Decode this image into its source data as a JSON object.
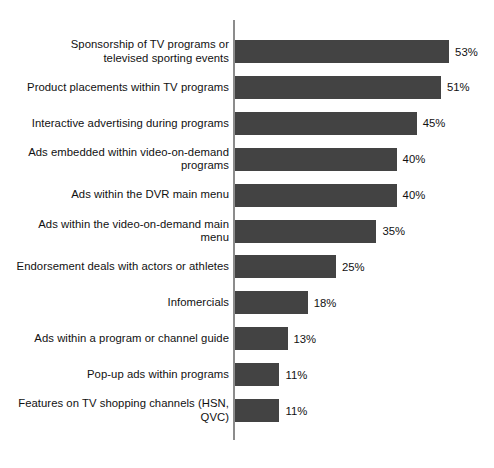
{
  "chart_data": {
    "type": "bar",
    "orientation": "horizontal",
    "title": "",
    "subtitle": "",
    "xlabel": "",
    "ylabel": "",
    "xlim": [
      0,
      53
    ],
    "grid": false,
    "legend": null,
    "value_suffix": "%",
    "bar_color": "#434343",
    "axis_color": "#8c8c8c",
    "background_color": "#ffffff",
    "text_color": "#111111",
    "categories": [
      "Sponsorship of TV programs or\ntelevised sporting events",
      "Product placements within TV programs",
      "Interactive advertising during programs",
      "Ads embedded within video-on-demand\nprograms",
      "Ads within the DVR main menu",
      "Ads within the video-on-demand main menu",
      "Endorsement deals with actors or athletes",
      "Infomercials",
      "Ads within a program or channel guide",
      "Pop-up ads within programs",
      "Features on TV shopping channels (HSN, QVC)"
    ],
    "values": [
      53,
      51,
      45,
      40,
      40,
      35,
      25,
      18,
      13,
      11,
      11
    ],
    "value_labels": [
      "53%",
      "51%",
      "45%",
      "40%",
      "40%",
      "35%",
      "25%",
      "18%",
      "13%",
      "11%",
      "11%"
    ]
  }
}
